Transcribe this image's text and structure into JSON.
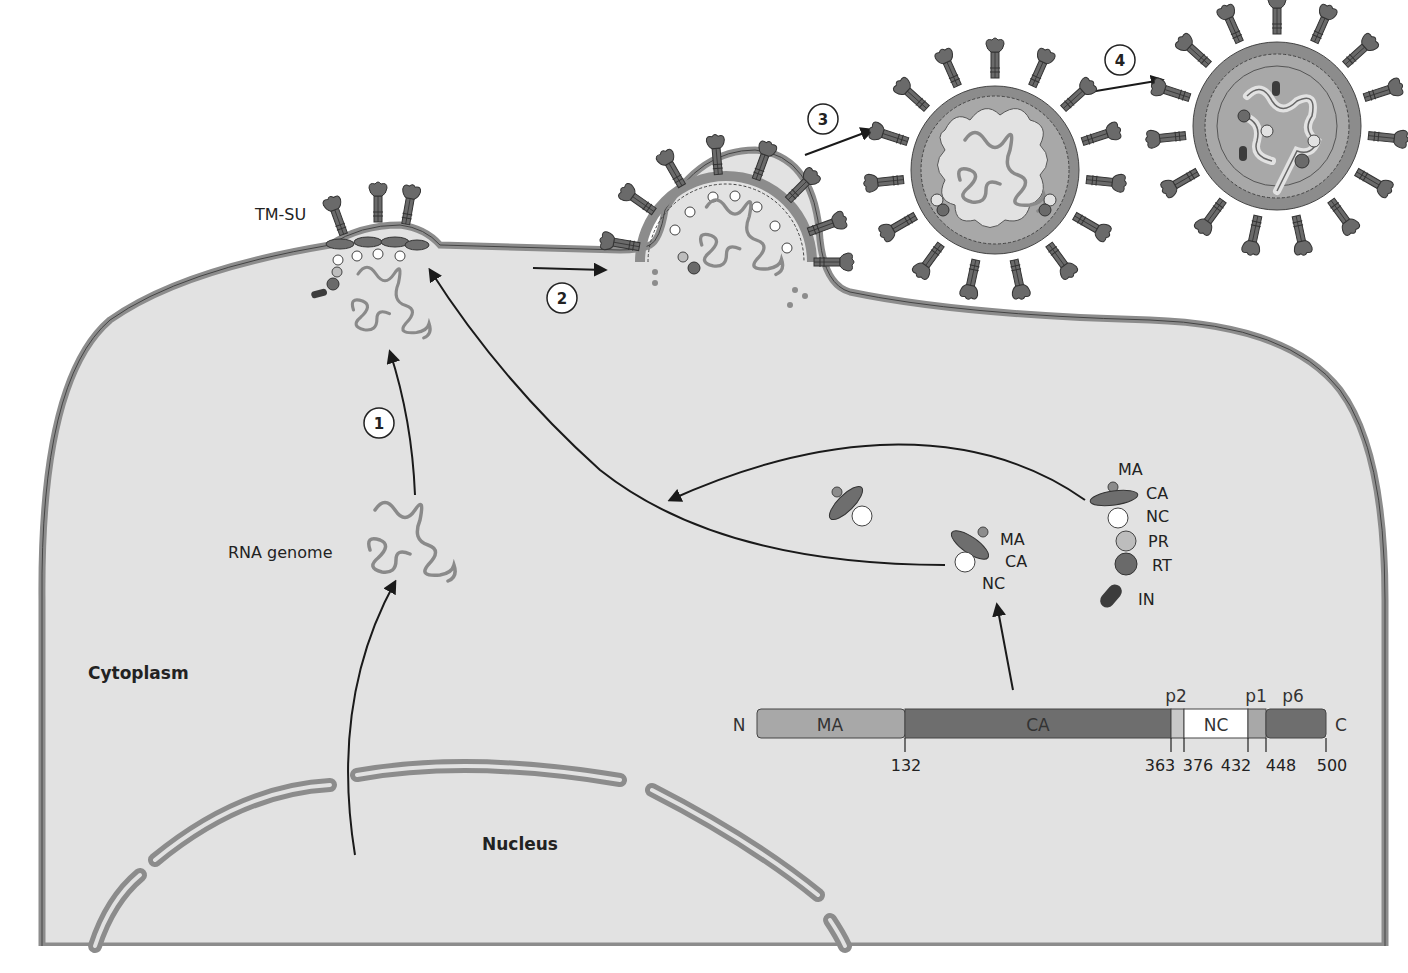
{
  "colors": {
    "cytoplasm": "#e2e2e2",
    "membrane": "#8c8c8c",
    "membrane_edge": "#444444",
    "ma": "#a8a8a8",
    "ca": "#6e6e6e",
    "nc": "#ffffff",
    "pr": "#bdbdbd",
    "rt": "#6a6a6a",
    "in": "#3c3c3c",
    "rna": "#8a8a8a",
    "arrow": "#1a1a1a"
  },
  "labels": {
    "tm_su": "TM-SU",
    "rna_genome": "RNA genome",
    "cytoplasm": "Cytoplasm",
    "nucleus": "Nucleus"
  },
  "steps": [
    {
      "id": "1",
      "label": "1"
    },
    {
      "id": "2",
      "label": "2"
    },
    {
      "id": "3",
      "label": "3"
    },
    {
      "id": "4",
      "label": "4"
    }
  ],
  "gag_small": {
    "labels": [
      "MA",
      "CA",
      "NC"
    ]
  },
  "gag_pol": {
    "labels": [
      "MA",
      "CA",
      "NC",
      "PR",
      "RT",
      "IN"
    ]
  },
  "gag_polyprotein": {
    "n_terminus": "N",
    "c_terminus": "C",
    "segments": [
      {
        "name": "MA",
        "start": 1,
        "end": 132,
        "label": "MA"
      },
      {
        "name": "CA",
        "start": 132,
        "end": 363,
        "label": "CA"
      },
      {
        "name": "p2",
        "start": 363,
        "end": 376,
        "label": "p2"
      },
      {
        "name": "NC",
        "start": 376,
        "end": 432,
        "label": "NC"
      },
      {
        "name": "p1",
        "start": 432,
        "end": 448,
        "label": "p1"
      },
      {
        "name": "p6",
        "start": 448,
        "end": 500,
        "label": "p6"
      }
    ],
    "ticks": [
      "132",
      "363",
      "376",
      "432",
      "448",
      "500"
    ]
  }
}
